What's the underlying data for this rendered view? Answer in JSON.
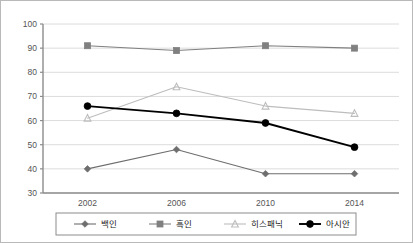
{
  "chart_data": {
    "type": "line",
    "title": "",
    "subtitle": "",
    "xlabel": "",
    "ylabel": "",
    "categories": [
      "2002",
      "2006",
      "2010",
      "2014"
    ],
    "x": [
      2002,
      2006,
      2010,
      2014
    ],
    "ylim": [
      30,
      100
    ],
    "y_ticks": [
      30,
      40,
      50,
      60,
      70,
      80,
      90,
      100
    ],
    "grid": true,
    "legend_position": "bottom",
    "series": [
      {
        "name": "백인",
        "values": [
          40,
          48,
          38,
          38
        ],
        "color": "#6e6e6e",
        "marker": "diamond"
      },
      {
        "name": "흑인",
        "values": [
          91,
          89,
          91,
          90
        ],
        "color": "#808080",
        "marker": "square"
      },
      {
        "name": "히스패닉",
        "values": [
          61,
          74,
          66,
          63
        ],
        "color": "#bdbdbd",
        "marker": "triangle"
      },
      {
        "name": "아시안",
        "values": [
          66,
          63,
          59,
          49
        ],
        "color": "#000000",
        "marker": "circle"
      }
    ]
  },
  "axes": {
    "y_tick_labels": [
      "100",
      "90",
      "80",
      "70",
      "60",
      "50",
      "40",
      "30"
    ],
    "x_tick_labels": [
      "2002",
      "2006",
      "2010",
      "2014"
    ]
  },
  "legend": {
    "items": [
      {
        "label": "백인",
        "marker": "diamond",
        "color": "#6e6e6e"
      },
      {
        "label": "흑인",
        "marker": "square",
        "color": "#808080"
      },
      {
        "label": "히스패닉",
        "marker": "triangle",
        "color": "#bdbdbd"
      },
      {
        "label": "아시안",
        "marker": "circle",
        "color": "#000000"
      }
    ]
  },
  "style": {
    "axis_color": "#8c8c8c",
    "grid_color": "#dcdcdc",
    "border_color": "#b9b9b9",
    "background": "#ffffff"
  }
}
